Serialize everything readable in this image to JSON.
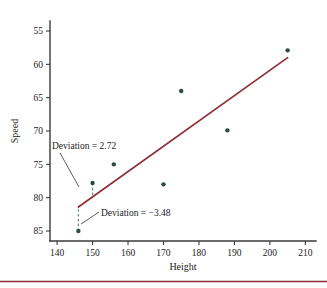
{
  "chart_data": {
    "type": "scatter",
    "title": "",
    "xlabel": "Height",
    "ylabel": "Speed",
    "xlim": [
      138,
      213
    ],
    "ylim": [
      53.5,
      86.5
    ],
    "xticks": [
      140,
      150,
      160,
      170,
      180,
      190,
      200,
      210
    ],
    "yticks": [
      55,
      60,
      65,
      70,
      75,
      80,
      85
    ],
    "grid": false,
    "legend": "none",
    "points": [
      {
        "x": 146,
        "y": 55.0
      },
      {
        "x": 150,
        "y": 62.2
      },
      {
        "x": 156,
        "y": 65.0
      },
      {
        "x": 170,
        "y": 62.0
      },
      {
        "x": 175,
        "y": 76.0
      },
      {
        "x": 188,
        "y": 70.1
      },
      {
        "x": 205,
        "y": 82.1
      }
    ],
    "series": [
      {
        "name": "regression-line",
        "type": "line",
        "color": "#8e2f38",
        "x": [
          146,
          205
        ],
        "y": [
          58.6,
          81.0
        ]
      }
    ],
    "deviation_segments": [
      {
        "x": 150,
        "y_point": 62.2,
        "y_line": 59.9,
        "value": 2.72,
        "color": "#6f8a7a"
      },
      {
        "x": 146,
        "y_point": 55.0,
        "y_line": 58.6,
        "value": -3.48,
        "color": "#6f8a7a"
      }
    ],
    "annotations": [
      {
        "id": "deviation-positive",
        "text": "Deviation = 2.72",
        "x": 147.5,
        "y": 66.8
      },
      {
        "id": "deviation-negative",
        "text": "Deviation = −3.48",
        "x": 158.5,
        "y": 57.9
      }
    ],
    "point_color": "#2c4a4a",
    "line_color": "#8e2f38"
  },
  "axes": {
    "y_tick_labels": [
      "85",
      "80",
      "75",
      "70",
      "65",
      "60",
      "55"
    ],
    "x_tick_labels": [
      "140",
      "150",
      "160",
      "170",
      "180",
      "190",
      "200",
      "210"
    ],
    "x_title": "Height",
    "y_title": "Speed"
  },
  "annotations": {
    "positive": "Deviation = 2.72",
    "negative": "Deviation = −3.48"
  },
  "colors": {
    "point": "#2c4a4a",
    "regression": "#8e2f38",
    "deviation": "#6f8a7a",
    "axis": "#3a3a3a",
    "rule": "#8e2f38",
    "background": "#ffffff"
  }
}
